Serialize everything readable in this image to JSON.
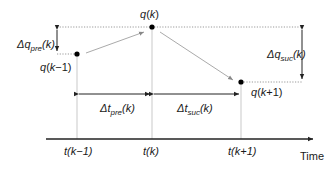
{
  "diagram": {
    "points": {
      "prev": {
        "label_var": "q",
        "label_arg_pre": "(",
        "label_arg_k": "k",
        "label_arg_post": "−1)",
        "id": "q(k-1)"
      },
      "curr": {
        "label_var": "q",
        "label_arg_pre": "(",
        "label_arg_k": "k",
        "label_arg_post": ")",
        "id": "q(k)"
      },
      "next": {
        "label_var": "q",
        "label_arg_pre": "(",
        "label_arg_k": "k",
        "label_arg_post": "+1)",
        "id": "q(k+1)"
      }
    },
    "deltas": {
      "dq_pre": {
        "symbol": "Δq",
        "sub": "pre",
        "arg": "(k)"
      },
      "dq_suc": {
        "symbol": "Δq",
        "sub": "suc",
        "arg": "(k)"
      },
      "dt_pre": {
        "symbol": "Δt",
        "sub": "pre",
        "arg": "(k)"
      },
      "dt_suc": {
        "symbol": "Δt",
        "sub": "suc",
        "arg": "(k)"
      }
    },
    "axis": {
      "label": "Time",
      "ticks": [
        "t(k−1)",
        "t(k)",
        "t(k+1)"
      ]
    }
  }
}
